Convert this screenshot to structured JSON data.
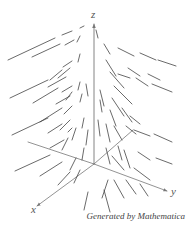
{
  "figure": {
    "type": "3d-vector-field",
    "caption": "Generated by Mathematica",
    "stroke_color": "#444444",
    "axis_color": "#777777"
  },
  "axes": {
    "origin": [
      94,
      164
    ],
    "z": {
      "label": "z",
      "end": [
        94,
        24
      ],
      "label_pos": [
        91,
        9
      ]
    },
    "y": {
      "label": "y",
      "end": [
        167,
        191
      ],
      "label_pos": [
        171,
        186
      ]
    },
    "x": {
      "label": "x",
      "end": [
        37,
        206
      ],
      "label_pos": [
        31,
        204
      ]
    },
    "neg_y": {
      "end": [
        28,
        142
      ]
    },
    "neg_x": {
      "end": [
        133,
        130
      ]
    }
  },
  "vectors": [
    [
      8,
      60,
      55,
      38
    ],
    [
      62,
      35,
      72,
      31
    ],
    [
      80,
      28,
      84,
      26
    ],
    [
      32,
      57,
      60,
      44
    ],
    [
      65,
      45,
      74,
      40
    ],
    [
      77,
      42,
      80,
      36
    ],
    [
      50,
      80,
      62,
      70
    ],
    [
      63,
      67,
      72,
      61
    ],
    [
      78,
      62,
      80,
      54
    ],
    [
      48,
      87,
      66,
      77
    ],
    [
      58,
      78,
      70,
      68
    ],
    [
      10,
      98,
      48,
      80
    ],
    [
      33,
      103,
      58,
      88
    ],
    [
      62,
      92,
      72,
      86
    ],
    [
      78,
      90,
      80,
      82
    ],
    [
      56,
      104,
      70,
      96
    ],
    [
      66,
      100,
      72,
      92
    ],
    [
      86,
      84,
      88,
      96
    ],
    [
      12,
      135,
      48,
      118
    ],
    [
      40,
      122,
      62,
      108
    ],
    [
      64,
      114,
      72,
      106
    ],
    [
      80,
      102,
      82,
      94
    ],
    [
      48,
      133,
      62,
      124
    ],
    [
      60,
      130,
      70,
      120
    ],
    [
      68,
      132,
      72,
      128
    ],
    [
      82,
      128,
      84,
      118
    ],
    [
      50,
      148,
      64,
      140
    ],
    [
      62,
      150,
      68,
      138
    ],
    [
      72,
      140,
      76,
      128
    ],
    [
      86,
      145,
      88,
      130
    ],
    [
      15,
      171,
      50,
      155
    ],
    [
      40,
      176,
      62,
      162
    ],
    [
      70,
      170,
      76,
      158
    ],
    [
      82,
      160,
      84,
      148
    ],
    [
      58,
      185,
      70,
      172
    ],
    [
      74,
      183,
      80,
      170
    ],
    [
      84,
      210,
      88,
      192
    ],
    [
      102,
      198,
      108,
      180
    ],
    [
      110,
      212,
      104,
      190
    ],
    [
      124,
      198,
      114,
      180
    ],
    [
      98,
      38,
      96,
      30
    ],
    [
      104,
      44,
      110,
      54
    ],
    [
      118,
      48,
      134,
      56
    ],
    [
      140,
      53,
      156,
      60
    ],
    [
      158,
      60,
      176,
      66
    ],
    [
      106,
      60,
      116,
      76
    ],
    [
      128,
      68,
      140,
      76
    ],
    [
      148,
      74,
      160,
      80
    ],
    [
      110,
      72,
      124,
      88
    ],
    [
      114,
      86,
      132,
      104
    ],
    [
      100,
      90,
      104,
      106
    ],
    [
      112,
      98,
      124,
      116
    ],
    [
      122,
      108,
      132,
      122
    ],
    [
      118,
      74,
      130,
      78
    ],
    [
      136,
      78,
      148,
      86
    ],
    [
      152,
      84,
      172,
      92
    ],
    [
      98,
      120,
      100,
      136
    ],
    [
      106,
      124,
      110,
      142
    ],
    [
      114,
      126,
      122,
      140
    ],
    [
      126,
      126,
      136,
      134
    ],
    [
      134,
      130,
      150,
      136
    ],
    [
      154,
      134,
      172,
      142
    ],
    [
      100,
      100,
      102,
      112
    ],
    [
      110,
      110,
      116,
      126
    ],
    [
      130,
      116,
      140,
      124
    ],
    [
      106,
      148,
      110,
      164
    ],
    [
      118,
      146,
      122,
      160
    ],
    [
      124,
      150,
      130,
      168
    ],
    [
      138,
      152,
      150,
      160
    ],
    [
      156,
      158,
      172,
      164
    ],
    [
      112,
      156,
      124,
      170
    ],
    [
      134,
      168,
      150,
      180
    ],
    [
      126,
      180,
      136,
      194
    ],
    [
      140,
      184,
      148,
      196
    ]
  ]
}
